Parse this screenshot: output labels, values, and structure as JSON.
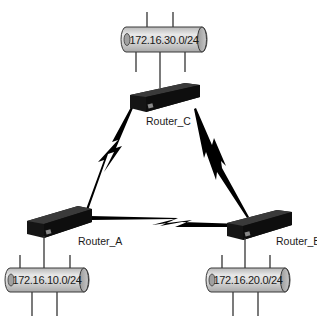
{
  "diagram": {
    "type": "network-topology",
    "routers": [
      {
        "id": "C",
        "label": "Router_C"
      },
      {
        "id": "A",
        "label": "Router_A"
      },
      {
        "id": "B",
        "label": "Router_B"
      }
    ],
    "networks": [
      {
        "id": "netC",
        "label": "172.16.30.0/24",
        "attached_router": "Router_C"
      },
      {
        "id": "netA",
        "label": "172.16.10.0/24",
        "attached_router": "Router_A"
      },
      {
        "id": "netB",
        "label": "172.16.20.0/24",
        "attached_router": "Router_B"
      }
    ],
    "links": [
      {
        "from": "Router_C",
        "to": "Router_A",
        "type": "serial-wan"
      },
      {
        "from": "Router_C",
        "to": "Router_B",
        "type": "serial-wan"
      },
      {
        "from": "Router_A",
        "to": "Router_B",
        "type": "serial-wan"
      }
    ],
    "colors": {
      "router_body": "#1c1c1c",
      "pipe_fill": "#d4d4d4",
      "pipe_stroke": "#3a3a3a",
      "link": "#000000"
    }
  }
}
